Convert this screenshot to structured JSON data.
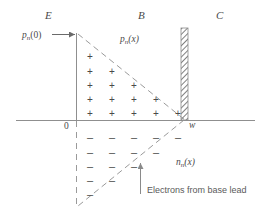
{
  "figure": {
    "type": "semiconductor-carrier-distribution-diagram",
    "regions": [
      {
        "name": "emitter",
        "label": "E",
        "x": 45,
        "y": 16
      },
      {
        "name": "base",
        "label": "B",
        "x": 138,
        "y": 16
      },
      {
        "name": "collector",
        "label": "C",
        "x": 216,
        "y": 16
      }
    ],
    "curve_labels": [
      {
        "name": "hole-boundary-value",
        "text_main": "p",
        "sub": "n",
        "args": "(0)",
        "x": 26,
        "y": 38
      },
      {
        "name": "hole-distribution",
        "text_main": "p",
        "sub": "n",
        "args": "(x)",
        "x": 120,
        "y": 40
      },
      {
        "name": "electron-distribution",
        "text_main": "n",
        "sub": "n",
        "args": "(x)",
        "x": 176,
        "y": 164
      }
    ],
    "axis_labels": [
      {
        "name": "origin-label",
        "text": "0",
        "x": 64,
        "y": 126
      },
      {
        "name": "base-width-label",
        "text": "w",
        "x": 190,
        "y": 124
      }
    ],
    "caption": {
      "name": "electrons-from-base-lead",
      "text": "Electrons from base lead",
      "x": 147,
      "y": 192
    },
    "plus_rows": [
      {
        "y": 52,
        "count": 1
      },
      {
        "y": 67,
        "count": 2
      },
      {
        "y": 81,
        "count": 3
      },
      {
        "y": 95,
        "count": 4
      },
      {
        "y": 109,
        "count": 5
      }
    ],
    "minus_rows": [
      {
        "y": 132,
        "count": 5
      },
      {
        "y": 147,
        "count": 4
      },
      {
        "y": 161,
        "count": 3
      },
      {
        "y": 175,
        "count": 2
      },
      {
        "y": 189,
        "count": 1
      }
    ],
    "sign_geometry": {
      "x_start": 90,
      "x_step": 22,
      "plus_glyph": "+",
      "minus_glyph": "–"
    },
    "geometry": {
      "axis_y": 120,
      "axis_x_left": 16,
      "axis_x_right": 255,
      "origin_x": 76,
      "w_x": 184,
      "top_y": 33,
      "bottom_y": 205,
      "barrier_x": 184,
      "barrier_top": 28,
      "barrier_width": 7
    },
    "colors": {
      "line": "#8a8a8a",
      "text": "#4f4f4f",
      "background": "#ffffff",
      "hatch": "#7a7a7a"
    }
  }
}
